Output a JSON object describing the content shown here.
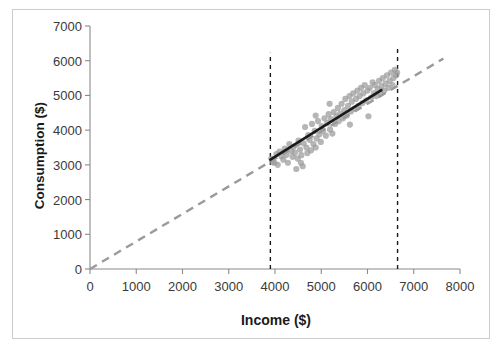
{
  "chart_data": {
    "type": "scatter",
    "title": "",
    "xlabel": "Income ($)",
    "ylabel": "Consumption ($)",
    "xlim": [
      0,
      8000
    ],
    "ylim": [
      0,
      7000
    ],
    "xticks": [
      0,
      1000,
      2000,
      3000,
      4000,
      5000,
      6000,
      7000,
      8000
    ],
    "yticks": [
      0,
      1000,
      2000,
      3000,
      4000,
      5000,
      6000,
      7000
    ],
    "xtick_labels": [
      "0",
      "1000",
      "2000",
      "3000",
      "4000",
      "5000",
      "6000",
      "7000",
      "8000"
    ],
    "ytick_labels": [
      "0",
      "1000",
      "2000",
      "3000",
      "4000",
      "5000",
      "6000",
      "7000"
    ],
    "grid": false,
    "legend": null,
    "series": [
      {
        "name": "observations",
        "type": "scatter",
        "marker": "circle",
        "color": "#9a9a9a",
        "points": [
          [
            3920,
            3180
          ],
          [
            3950,
            3080
          ],
          [
            3990,
            3060
          ],
          [
            4030,
            3310
          ],
          [
            4060,
            3000
          ],
          [
            4100,
            3380
          ],
          [
            4140,
            3250
          ],
          [
            4180,
            3150
          ],
          [
            4210,
            3470
          ],
          [
            4250,
            3290
          ],
          [
            4280,
            3060
          ],
          [
            4310,
            3600
          ],
          [
            4350,
            3400
          ],
          [
            4380,
            3230
          ],
          [
            4400,
            3520
          ],
          [
            4430,
            3350
          ],
          [
            4460,
            2880
          ],
          [
            4490,
            3180
          ],
          [
            4510,
            3700
          ],
          [
            4540,
            3440
          ],
          [
            4570,
            3280
          ],
          [
            4600,
            2960
          ],
          [
            4620,
            3620
          ],
          [
            4650,
            4090
          ],
          [
            4680,
            3500
          ],
          [
            4700,
            3340
          ],
          [
            4720,
            3860
          ],
          [
            4750,
            3720
          ],
          [
            4780,
            3420
          ],
          [
            4800,
            4180
          ],
          [
            4830,
            3600
          ],
          [
            4860,
            3980
          ],
          [
            4880,
            3500
          ],
          [
            4900,
            3760
          ],
          [
            4930,
            4260
          ],
          [
            4960,
            3880
          ],
          [
            4990,
            3660
          ],
          [
            5010,
            4120
          ],
          [
            5040,
            3980
          ],
          [
            5070,
            4340
          ],
          [
            5100,
            3840
          ],
          [
            5130,
            4200
          ],
          [
            5160,
            4460
          ],
          [
            5190,
            4020
          ],
          [
            5210,
            4320
          ],
          [
            5240,
            3900
          ],
          [
            5270,
            4520
          ],
          [
            5300,
            4180
          ],
          [
            5330,
            4400
          ],
          [
            5360,
            4640
          ],
          [
            5380,
            4260
          ],
          [
            5410,
            4480
          ],
          [
            5440,
            4760
          ],
          [
            5470,
            4340
          ],
          [
            5500,
            4580
          ],
          [
            5520,
            4900
          ],
          [
            5550,
            4420
          ],
          [
            5580,
            4700
          ],
          [
            5610,
            4980
          ],
          [
            5640,
            4540
          ],
          [
            5660,
            4820
          ],
          [
            5690,
            5060
          ],
          [
            5720,
            4620
          ],
          [
            5750,
            4900
          ],
          [
            5780,
            5140
          ],
          [
            5800,
            4700
          ],
          [
            5830,
            4980
          ],
          [
            5860,
            5220
          ],
          [
            5890,
            4780
          ],
          [
            5910,
            5060
          ],
          [
            5940,
            5300
          ],
          [
            5970,
            4860
          ],
          [
            6000,
            5140
          ],
          [
            6020,
            4400
          ],
          [
            6050,
            5220
          ],
          [
            6080,
            4940
          ],
          [
            6110,
            5380
          ],
          [
            6140,
            5060
          ],
          [
            6160,
            5300
          ],
          [
            6190,
            4980
          ],
          [
            6220,
            5180
          ],
          [
            6250,
            5420
          ],
          [
            6280,
            5060
          ],
          [
            6300,
            5260
          ],
          [
            6330,
            5500
          ],
          [
            6360,
            5140
          ],
          [
            6390,
            5340
          ],
          [
            6420,
            5580
          ],
          [
            6450,
            5220
          ],
          [
            6480,
            5420
          ],
          [
            6510,
            5660
          ],
          [
            6540,
            5300
          ],
          [
            6560,
            5500
          ],
          [
            6590,
            5740
          ],
          [
            6620,
            5580
          ],
          [
            6640,
            5660
          ],
          [
            5620,
            4160
          ],
          [
            5180,
            4760
          ],
          [
            4880,
            4420
          ],
          [
            4560,
            3060
          ]
        ]
      },
      {
        "name": "fitted-regression-line",
        "type": "line",
        "style": "solid",
        "color": "#1a1a1a",
        "width": 2.6,
        "x": [
          3900,
          6300
        ],
        "y": [
          3150,
          5150
        ]
      },
      {
        "name": "reference-45-degree-line",
        "type": "line",
        "style": "dashed",
        "color": "#9a9a9a",
        "width": 2.4,
        "x": [
          0,
          7640
        ],
        "y": [
          0,
          6060
        ]
      }
    ],
    "annotations": [
      {
        "name": "lower-bound-marker",
        "type": "vertical-line",
        "style": "dashed",
        "color": "#1a1a1a",
        "x": 3900,
        "y_from": 0,
        "y_to": 6230
      },
      {
        "name": "upper-bound-marker",
        "type": "vertical-line",
        "style": "dashed",
        "color": "#1a1a1a",
        "x": 6650,
        "y_from": 0,
        "y_to": 6400
      }
    ]
  }
}
